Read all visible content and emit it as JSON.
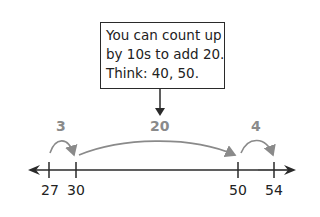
{
  "callout": {
    "lines": [
      "You can count up",
      "by 10s to add 20.",
      "Think: 40, 50."
    ]
  },
  "number_line": {
    "ticks": [
      "27",
      "30",
      "50",
      "54"
    ],
    "jumps": [
      {
        "from": "27",
        "to": "30",
        "label": "3"
      },
      {
        "from": "30",
        "to": "50",
        "label": "20"
      },
      {
        "from": "50",
        "to": "54",
        "label": "4"
      }
    ]
  },
  "colors": {
    "line": "#2a2a2a",
    "jump_arrow": "#8a8a8a",
    "jump_label": "#8a8a8a"
  }
}
